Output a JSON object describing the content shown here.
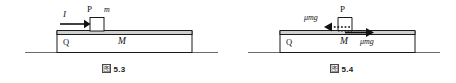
{
  "figures": [
    {
      "id": "fig-5-3",
      "caption_symbol": "图",
      "caption_number": "5.3",
      "labels": {
        "impulse": "I",
        "block_small": "P",
        "mass_small": "m",
        "surface": "Q",
        "mass_large": "M"
      }
    },
    {
      "id": "fig-5-4",
      "caption_symbol": "图",
      "caption_number": "5.4",
      "labels": {
        "friction_left": "μmg",
        "block_small": "P",
        "surface": "Q",
        "mass_large": "M",
        "friction_right": "μmg"
      }
    }
  ],
  "colors": {
    "stroke": "#1a1a1a",
    "ground": "#6b6b6b",
    "slab_top": "#cfcfcf",
    "slab_fill": "#ffffff",
    "block_fill": "#ffffff",
    "caption_text": "#1a1a1a"
  }
}
